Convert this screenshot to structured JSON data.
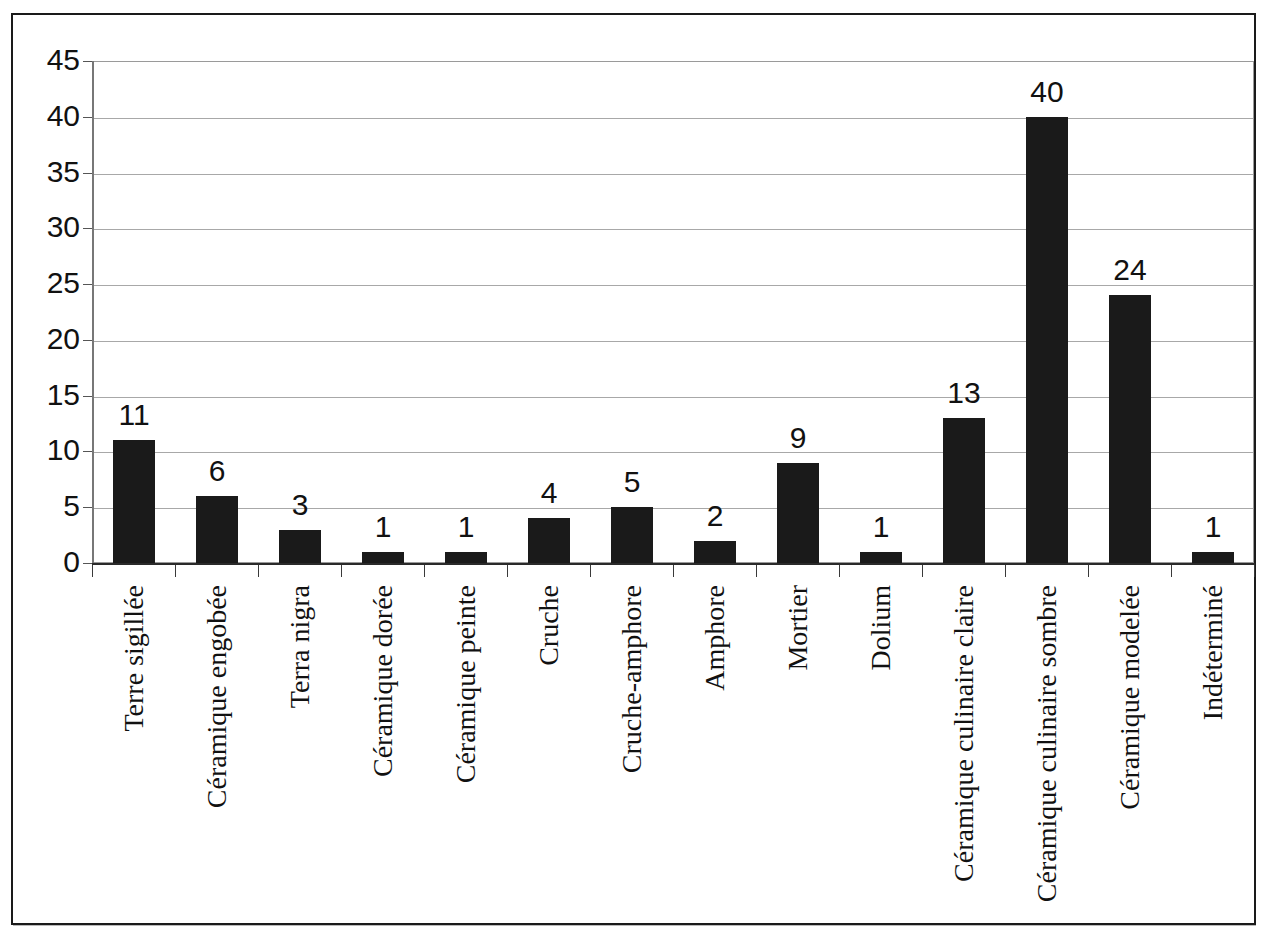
{
  "chart_data": {
    "type": "bar",
    "title": "",
    "subtitle": "",
    "xlabel": "",
    "ylabel": "",
    "ylim": [
      0,
      45
    ],
    "ytick_step": 5,
    "yticks": [
      45,
      40,
      35,
      30,
      25,
      20,
      15,
      10,
      5,
      0
    ],
    "grid": true,
    "legend": null,
    "bar_color": "#1a1a1a",
    "gridline_color": "#a8a8a8",
    "axis_color": "#2a2a2a",
    "categories": [
      "Terre sigillée",
      "Céramique engobée",
      "Terra nigra",
      "Céramique dorée",
      "Céramique peinte",
      "Cruche",
      "Cruche-amphore",
      "Amphore",
      "Mortier",
      "Dolium",
      "Céramique culinaire claire",
      "Céramique culinaire sombre",
      "Céramique modelée",
      "Indéterminé"
    ],
    "values": [
      11,
      6,
      3,
      1,
      1,
      4,
      5,
      2,
      9,
      1,
      13,
      40,
      24,
      1
    ],
    "data_labels": [
      "11",
      "6",
      "3",
      "1",
      "1",
      "4",
      "5",
      "2",
      "9",
      "1",
      "13",
      "40",
      "24",
      "1"
    ]
  }
}
